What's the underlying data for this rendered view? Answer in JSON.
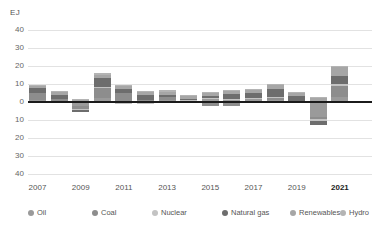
{
  "chart_data": {
    "type": "bar",
    "title": "",
    "subtitle": "",
    "xlabel": "",
    "ylabel": "EJ",
    "ylim": [
      -40,
      40
    ],
    "grid": true,
    "stacked": true,
    "legend_position": "bottom",
    "note": "Stacked bar chart of annual change in primary energy consumption by fuel, exajoules.",
    "x": [
      2007,
      2008,
      2009,
      2010,
      2011,
      2012,
      2013,
      2014,
      2015,
      2016,
      2017,
      2018,
      2019,
      2020,
      2021
    ],
    "categories": [
      "2007",
      "2008",
      "2009",
      "2010",
      "2011",
      "2012",
      "2013",
      "2014",
      "2015",
      "2016",
      "2017",
      "2018",
      "2019",
      "2020",
      "2021"
    ],
    "x_tick_labels": [
      "2007",
      "2009",
      "2011",
      "2013",
      "2015",
      "2017",
      "2019",
      "2021"
    ],
    "x_tick_values": [
      2007,
      2009,
      2011,
      2013,
      2015,
      2017,
      2019,
      2021
    ],
    "x_tick_bold": [
      false,
      false,
      false,
      false,
      false,
      false,
      false,
      true
    ],
    "y_tick_labels": [
      "40",
      "30",
      "20",
      "10",
      "0",
      "10",
      "20",
      "30",
      "40"
    ],
    "y_tick_values": [
      40,
      30,
      20,
      10,
      0,
      -10,
      -20,
      -30,
      -40
    ],
    "series": [
      {
        "name": "Oil",
        "color": "#9a9a9a",
        "values": [
          1.0,
          0.3,
          -2.4,
          2.2,
          0.6,
          0.8,
          1.2,
          0.6,
          1.8,
          1.6,
          1.4,
          1.3,
          0.4,
          -8.6,
          3.0
        ]
      },
      {
        "name": "Coal",
        "color": "#8d8d8d",
        "values": [
          4.1,
          1.6,
          -1.4,
          6.0,
          4.4,
          0.4,
          1.4,
          0.3,
          -2.2,
          -2.0,
          0.6,
          1.3,
          -0.6,
          -1.1,
          6.0
        ]
      },
      {
        "name": "Nuclear",
        "color": "#c3c3c3",
        "values": [
          -0.6,
          -0.2,
          -0.4,
          0.3,
          -1.2,
          -1.2,
          -0.1,
          0.4,
          0.4,
          0.3,
          0.2,
          0.3,
          0.4,
          -0.9,
          0.8
        ]
      },
      {
        "name": "Natural gas",
        "color": "#6d6d6d",
        "values": [
          2.6,
          2.1,
          -1.3,
          5.1,
          2.2,
          2.6,
          1.4,
          0.3,
          1.3,
          2.3,
          2.6,
          4.4,
          2.4,
          -2.4,
          4.9
        ]
      },
      {
        "name": "Renewables",
        "color": "#a6a6a6",
        "values": [
          1.0,
          1.3,
          1.1,
          1.6,
          1.6,
          1.5,
          1.8,
          1.9,
          1.8,
          1.9,
          2.1,
          2.3,
          2.1,
          2.4,
          4.8
        ]
      },
      {
        "name": "Hydro",
        "color": "#b4b4b4",
        "values": [
          0.6,
          0.6,
          0.4,
          1.0,
          0.5,
          0.9,
          0.9,
          0.4,
          0.2,
          0.6,
          0.4,
          0.6,
          0.4,
          0.6,
          0.4
        ]
      }
    ],
    "totals": [
      8.7,
      5.7,
      -4.0,
      16.2,
      8.1,
      5.0,
      6.6,
      3.9,
      3.3,
      4.7,
      7.3,
      10.2,
      5.1,
      -10.0,
      19.9
    ],
    "positive_totals": [
      9.3,
      5.9,
      1.5,
      16.2,
      9.3,
      6.2,
      6.7,
      3.9,
      5.5,
      6.7,
      7.3,
      10.2,
      5.7,
      3.0,
      19.9
    ],
    "negative_totals": [
      -0.6,
      -0.2,
      -5.5,
      0.0,
      -1.2,
      -1.2,
      -0.1,
      0.0,
      -2.2,
      -2.0,
      0.0,
      0.0,
      -0.6,
      -13.0,
      0.0
    ]
  },
  "axis": {
    "unit": "EJ"
  },
  "legend": {
    "items": [
      {
        "label": "Oil",
        "color": "#9a9a9a"
      },
      {
        "label": "Coal",
        "color": "#8d8d8d"
      },
      {
        "label": "Nuclear",
        "color": "#c3c3c3"
      },
      {
        "label": "Natural gas",
        "color": "#6d6d6d"
      },
      {
        "label": "Renewables",
        "color": "#a6a6a6"
      },
      {
        "label": "Hydro",
        "color": "#b4b4b4"
      }
    ]
  },
  "style": {
    "grid_color": "#e2e2e2",
    "zero_line_color": "#1b1b1b",
    "text_color": "#555555",
    "background": "#ffffff"
  }
}
